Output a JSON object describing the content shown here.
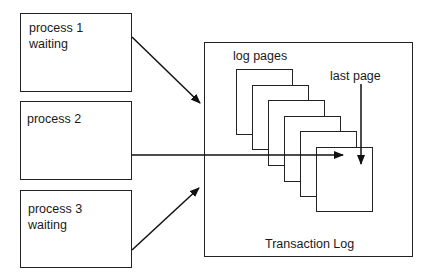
{
  "processes": [
    {
      "name": "process 1",
      "status": "waiting"
    },
    {
      "name": "process 2",
      "status": ""
    },
    {
      "name": "process 3",
      "status": "waiting"
    }
  ],
  "transaction_log": {
    "title": "Transaction Log",
    "pages_label": "log pages",
    "last_page_label": "last page",
    "page_count": 6
  },
  "colors": {
    "stroke": "#222222",
    "background": "#ffffff"
  }
}
